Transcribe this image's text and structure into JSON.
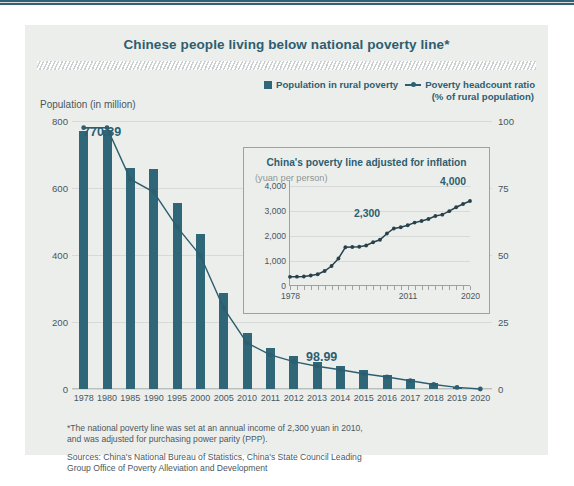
{
  "title": "Chinese people living below national poverty line*",
  "legend": {
    "bar_label": "Population in rural poverty",
    "line_label": "Poverty headcount ratio",
    "line_sublabel": "(% of rural population)"
  },
  "left_axis_caption": "Population (in million)",
  "annotations": {
    "first_value": "770.39",
    "mid_value": "98.99"
  },
  "notes": {
    "footnote_line1": "*The national poverty line was set at an annual income of 2,300 yuan in 2010,",
    "footnote_line2": "and was adjusted for purchasing power parity (PPP).",
    "sources_line1": "Sources: China's National Bureau of Statistics, China's State Council Leading",
    "sources_line2": "Group Office of Poverty Alleviation and Development"
  },
  "colors": {
    "bar": "#2f6678",
    "line": "#2d5e70",
    "title": "#2d5e70",
    "card_bg": "#eceeec",
    "grid": "#d6dad8"
  },
  "chart_data": {
    "type": "bar",
    "title": "Chinese people living below national poverty line*",
    "xlabel": "",
    "ylabel": "Population (in million)",
    "ylim": [
      0,
      800
    ],
    "y2label": "Poverty headcount ratio (% of rural population)",
    "y2lim": [
      0,
      100
    ],
    "grid": true,
    "legend_position": "top-right",
    "categories": [
      "1978",
      "1980",
      "1985",
      "1990",
      "1995",
      "2000",
      "2005",
      "2010",
      "2011",
      "2012",
      "2013",
      "2014",
      "2015",
      "2016",
      "2017",
      "2018",
      "2019",
      "2020"
    ],
    "yticks": [
      "0",
      "200",
      "400",
      "600",
      "800"
    ],
    "y2ticks": [
      "0",
      "25",
      "50",
      "75",
      "100"
    ],
    "series": [
      {
        "name": "Population in rural poverty",
        "type": "bar",
        "axis": "left",
        "unit": "million",
        "values": [
          770.39,
          774,
          661,
          658,
          554,
          462,
          286,
          166,
          122,
          98.99,
          82,
          70,
          56,
          43,
          30,
          17,
          6,
          0
        ]
      },
      {
        "name": "Poverty headcount ratio",
        "type": "line",
        "axis": "right",
        "unit": "% of rural population",
        "values": [
          97.5,
          97.5,
          78.3,
          73.5,
          60.5,
          49.8,
          30.2,
          17.2,
          12.7,
          10.2,
          8.5,
          7.2,
          5.7,
          4.5,
          3.1,
          1.7,
          0.6,
          0
        ]
      }
    ]
  },
  "inset": {
    "title": "China's poverty line adjusted for inflation",
    "subtitle": "(yuan per person)",
    "chart_data": {
      "type": "line",
      "title": "China's poverty line adjusted for inflation",
      "ylabel": "(yuan per person)",
      "ylim": [
        0,
        4000
      ],
      "yticks": [
        "0",
        "1,000",
        "2,000",
        "3,000",
        "4,000"
      ],
      "xticks_labeled": [
        "1978",
        "2011",
        "2020"
      ],
      "grid": true,
      "annotations": [
        {
          "label": "2,300",
          "x": "2010",
          "y": 2300
        },
        {
          "label": "4,000",
          "x": "2020",
          "y": 4000
        }
      ],
      "x": [
        "1978",
        "1980",
        "1982",
        "1984",
        "1986",
        "1988",
        "1990",
        "1992",
        "1994",
        "1996",
        "1998",
        "2000",
        "2002",
        "2004",
        "2006",
        "2008",
        "2010",
        "2011",
        "2012",
        "2013",
        "2014",
        "2015",
        "2016",
        "2017",
        "2018",
        "2019",
        "2020"
      ],
      "values": [
        366,
        375,
        380,
        420,
        470,
        600,
        800,
        1100,
        1550,
        1560,
        1570,
        1620,
        1750,
        1850,
        2100,
        2300,
        2350,
        2430,
        2536,
        2600,
        2680,
        2800,
        2855,
        2995,
        3150,
        3280,
        3400
      ]
    }
  }
}
